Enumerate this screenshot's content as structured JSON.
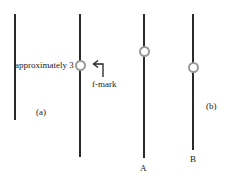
{
  "diagram": {
    "panel_a": {
      "label": "(a)",
      "annotation": "approximately 3",
      "marker_label": "f-mark"
    },
    "panel_b": {
      "label": "(b)",
      "rod_labels": [
        "A",
        "B"
      ]
    },
    "colors": {
      "line": "#2a2a2a",
      "ring": "#9a9a9a"
    }
  }
}
